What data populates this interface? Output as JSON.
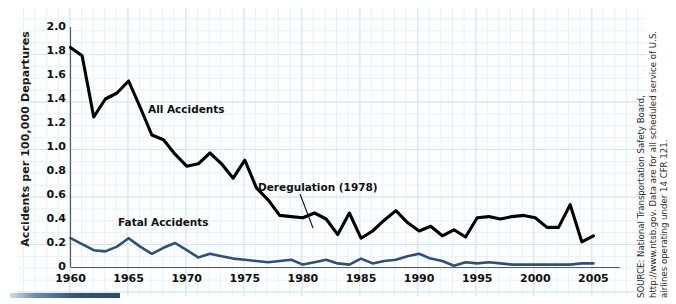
{
  "chart_data": {
    "type": "line",
    "title": "",
    "xlabel": "",
    "ylabel": "Accidents per 100,000 Departures",
    "xlim": [
      1960,
      2005
    ],
    "ylim": [
      0,
      2.0
    ],
    "grid": true,
    "legend_position": "inline-annotations",
    "x": [
      1960,
      1961,
      1962,
      1963,
      1964,
      1965,
      1966,
      1967,
      1968,
      1969,
      1970,
      1971,
      1972,
      1973,
      1974,
      1975,
      1976,
      1977,
      1978,
      1979,
      1980,
      1981,
      1982,
      1983,
      1984,
      1985,
      1986,
      1987,
      1988,
      1989,
      1990,
      1991,
      1992,
      1993,
      1994,
      1995,
      1996,
      1997,
      1998,
      1999,
      2000,
      2001,
      2002,
      2003,
      2004,
      2005
    ],
    "xtick_labels": [
      "1960",
      "1965",
      "1970",
      "1975",
      "1980",
      "1985",
      "1990",
      "1995",
      "2000",
      "2005"
    ],
    "xtick_values": [
      1960,
      1965,
      1970,
      1975,
      1980,
      1985,
      1990,
      1995,
      2000,
      2005
    ],
    "ytick_labels": [
      "0",
      "0.2",
      "0.4",
      "0.6",
      "0.8",
      "1.0",
      "1.2",
      "1.4",
      "1.6",
      "1.8",
      "2.0"
    ],
    "ytick_values": [
      0,
      0.2,
      0.4,
      0.6,
      0.8,
      1.0,
      1.2,
      1.4,
      1.6,
      1.8,
      2.0
    ],
    "series": [
      {
        "name": "All Accidents",
        "color": "#000000",
        "values": [
          1.83,
          1.76,
          1.25,
          1.4,
          1.45,
          1.55,
          1.33,
          1.1,
          1.06,
          0.94,
          0.84,
          0.86,
          0.95,
          0.86,
          0.74,
          0.89,
          0.66,
          0.56,
          0.43,
          0.42,
          0.41,
          0.45,
          0.4,
          0.27,
          0.45,
          0.24,
          0.3,
          0.39,
          0.47,
          0.37,
          0.3,
          0.34,
          0.26,
          0.31,
          0.25,
          0.41,
          0.42,
          0.4,
          0.42,
          0.43,
          0.41,
          0.33,
          0.33,
          0.52,
          0.21,
          0.26
        ]
      },
      {
        "name": "Fatal Accidents",
        "color": "#2d4f80",
        "values": [
          0.24,
          0.19,
          0.14,
          0.13,
          0.17,
          0.24,
          0.17,
          0.11,
          0.16,
          0.2,
          0.14,
          0.08,
          0.11,
          0.09,
          0.07,
          0.06,
          0.05,
          0.04,
          0.05,
          0.06,
          0.02,
          0.04,
          0.06,
          0.03,
          0.02,
          0.07,
          0.03,
          0.05,
          0.06,
          0.09,
          0.11,
          0.07,
          0.05,
          0.01,
          0.04,
          0.03,
          0.04,
          0.03,
          0.02,
          0.02,
          0.02,
          0.02,
          0.02,
          0.02,
          0.03,
          0.03
        ]
      }
    ],
    "annotations": [
      {
        "text": "Deregulation (1978)",
        "x": 1978,
        "y": 0.43
      },
      {
        "text": "All Accidents",
        "x": 1967,
        "y": 1.4
      },
      {
        "text": "Fatal Accidents",
        "x": 1965,
        "y": 0.47
      }
    ]
  },
  "labels": {
    "ylabel": "Accidents per 100,000 Departures",
    "all_accidents": "All Accidents",
    "fatal_accidents": "Fatal Accidents",
    "deregulation": "Deregulation (1978)"
  },
  "source": {
    "text": "SOURCE: National Transportation Safety Board, http://www.ntsb.gov. Data are for all scheduled service of U.S. airlines operating under 14 CFR 121."
  },
  "colors": {
    "all_accidents_line": "#000000",
    "fatal_accidents_line": "#2d4f80",
    "grid_major": "#cfe6ef",
    "grid_minor": "#e6f2f7",
    "axis": "#555555",
    "accent_bar": "#31527c"
  }
}
